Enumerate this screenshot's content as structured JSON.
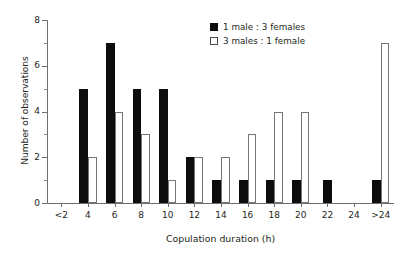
{
  "chart_data": {
    "type": "bar",
    "title": "",
    "subtitle": "",
    "xlabel": "Copulation duration (h)",
    "ylabel": "Number of observations",
    "categories": [
      "<2",
      "4",
      "6",
      "8",
      "10",
      "12",
      "14",
      "16",
      "18",
      "20",
      "22",
      "24",
      ">24"
    ],
    "series": [
      {
        "name": "1 male : 3 females",
        "style": "filled",
        "color": "#0d0d0d",
        "values": [
          0,
          5,
          7,
          5,
          5,
          2,
          1,
          1,
          1,
          1,
          1,
          0,
          1
        ]
      },
      {
        "name": "3 males : 1 female",
        "style": "open",
        "color": "#ffffff",
        "edge_color": "#77777a",
        "values": [
          0,
          2,
          4,
          3,
          1,
          2,
          2,
          3,
          4,
          4,
          0,
          0,
          7
        ]
      }
    ],
    "ylim": [
      0,
      8
    ],
    "y_ticks_major": [
      0,
      2,
      4,
      6,
      8
    ],
    "y_ticks_minor": [
      1,
      3,
      5,
      7
    ],
    "y_tick_labels": [
      "0",
      "2",
      "4",
      "6",
      "8"
    ],
    "grid": false,
    "legend_position": "top-right",
    "axis_color": "#6e6e70",
    "text_color": "#231f20"
  },
  "legend": {
    "entries": [
      {
        "label": "1 male : 3 females"
      },
      {
        "label": "3 males : 1 female"
      }
    ]
  },
  "axes": {
    "x_title": "Copulation duration (h)",
    "y_title": "Number of observations"
  }
}
